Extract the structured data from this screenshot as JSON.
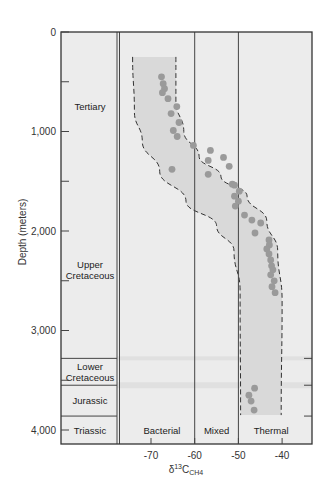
{
  "chart_data": {
    "type": "scatter",
    "title": "",
    "xlabel": "δ13C CH4",
    "xlabel_parts": {
      "delta": "δ",
      "sup": "13",
      "base": "C",
      "sub": "CH4"
    },
    "ylabel": "Depth (meters)",
    "xlim": [
      -76,
      -33
    ],
    "ylim": [
      4140,
      0
    ],
    "y_inverted": true,
    "x_ticks": [
      -70,
      -60,
      -50,
      -40
    ],
    "x_tick_labels": [
      "-70",
      "-60",
      "-50",
      "-40"
    ],
    "y_ticks": [
      0,
      500,
      1000,
      1500,
      2000,
      2500,
      3000,
      3500,
      4000
    ],
    "y_tick_labels": [
      "0",
      "",
      "1,000",
      "",
      "2,000",
      "",
      "3,000",
      "",
      "4,000"
    ],
    "grid": false,
    "zones": [
      {
        "name": "Bacterial",
        "x_from": -76,
        "x_to": -60
      },
      {
        "name": "Mixed",
        "x_from": -60,
        "x_to": -50
      },
      {
        "name": "Thermal",
        "x_from": -50,
        "x_to": -33
      }
    ],
    "zone_dividers": [
      -60,
      -50
    ],
    "stratigraphy": [
      {
        "name": "Tertiary",
        "top": 0,
        "bottom": 1500,
        "label_lines": [
          "Tertiary"
        ]
      },
      {
        "name": "Upper Cretaceous",
        "top": 1500,
        "bottom": 3280,
        "label_lines": [
          "Upper",
          "Cretaceous"
        ]
      },
      {
        "name": "Lower Cretaceous",
        "top": 3280,
        "bottom": 3550,
        "label_lines": [
          "Lower",
          "Cretaceous"
        ]
      },
      {
        "name": "Jurassic",
        "top": 3550,
        "bottom": 3860,
        "label_lines": [
          "Jurassic"
        ]
      },
      {
        "name": "Triassic",
        "top": 3860,
        "bottom": 4140,
        "label_lines": [
          "Triassic"
        ]
      }
    ],
    "envelope": {
      "description": "Dashed-line envelope enclosing data trend",
      "top_depth": 250,
      "bottom_depth": 3850,
      "left_boundary": [
        [
          -74.2,
          250
        ],
        [
          -73.8,
          800
        ],
        [
          -72,
          1100
        ],
        [
          -68,
          1400
        ],
        [
          -62,
          1700
        ],
        [
          -55,
          1950
        ],
        [
          -51,
          2200
        ],
        [
          -49.6,
          2600
        ],
        [
          -49.5,
          3850
        ]
      ],
      "right_boundary": [
        [
          -64.3,
          250
        ],
        [
          -64.3,
          700
        ],
        [
          -62.5,
          1000
        ],
        [
          -59,
          1250
        ],
        [
          -54,
          1450
        ],
        [
          -48,
          1650
        ],
        [
          -43.5,
          1900
        ],
        [
          -41,
          2200
        ],
        [
          -40,
          2700
        ],
        [
          -40.2,
          3850
        ]
      ]
    },
    "series": [
      {
        "name": "δ13C CH4 samples",
        "points": [
          [
            -67.6,
            450
          ],
          [
            -67.2,
            520
          ],
          [
            -66.9,
            570
          ],
          [
            -67.4,
            610
          ],
          [
            -66.1,
            670
          ],
          [
            -64.1,
            750
          ],
          [
            -65.4,
            820
          ],
          [
            -63.6,
            910
          ],
          [
            -64.9,
            990
          ],
          [
            -64.0,
            1050
          ],
          [
            -60.3,
            1140
          ],
          [
            -65.2,
            1380
          ],
          [
            -56.4,
            1190
          ],
          [
            -56.9,
            1290
          ],
          [
            -53.4,
            1260
          ],
          [
            -52.1,
            1350
          ],
          [
            -56.9,
            1430
          ],
          [
            -50.9,
            1540
          ],
          [
            -51.4,
            1530
          ],
          [
            -49.8,
            1600
          ],
          [
            -50.9,
            1650
          ],
          [
            -50.0,
            1700
          ],
          [
            -50.7,
            1750
          ],
          [
            -48.6,
            1840
          ],
          [
            -46.9,
            1890
          ],
          [
            -44.9,
            1920
          ],
          [
            -46.2,
            2020
          ],
          [
            -43.0,
            2090
          ],
          [
            -42.9,
            2140
          ],
          [
            -43.5,
            2180
          ],
          [
            -43.0,
            2230
          ],
          [
            -42.6,
            2290
          ],
          [
            -42.4,
            2350
          ],
          [
            -42.1,
            2390
          ],
          [
            -42.6,
            2440
          ],
          [
            -41.8,
            2500
          ],
          [
            -42.3,
            2560
          ],
          [
            -41.6,
            2620
          ],
          [
            -46.3,
            3580
          ],
          [
            -47.6,
            3650
          ],
          [
            -47.1,
            3710
          ],
          [
            -46.4,
            3800
          ]
        ]
      }
    ]
  },
  "style": {
    "background": "#ffffff",
    "plot_fill": "#ececec",
    "band_fill": "#d9d9d9",
    "point_color": "#9a9a9a",
    "line_color": "#444444",
    "faint_band": "#e0e0e0"
  }
}
